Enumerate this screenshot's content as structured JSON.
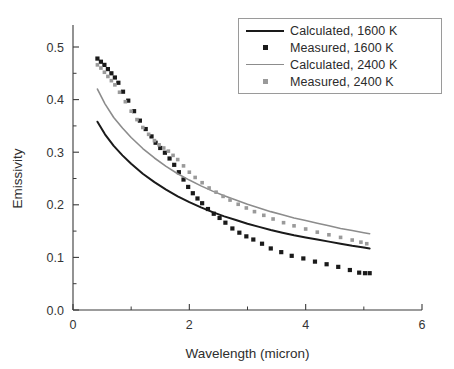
{
  "chart_data": {
    "type": "scatter",
    "title": "",
    "xlabel": "Wavelength (micron)",
    "ylabel": "Emissivity",
    "xlim": [
      0,
      6
    ],
    "ylim": [
      0.0,
      0.5
    ],
    "grid": false,
    "legend_position": "top-right",
    "x_ticks": [
      0,
      2,
      4,
      6
    ],
    "x_tick_labels": [
      "0",
      "2",
      "4",
      "6"
    ],
    "x_minor_ticks": [
      1,
      3,
      5
    ],
    "y_ticks": [
      0.0,
      0.1,
      0.2,
      0.3,
      0.4,
      0.5
    ],
    "y_tick_labels": [
      "0.0",
      "0.1",
      "0.2",
      "0.3",
      "0.4",
      "0.5"
    ],
    "y_minor_ticks": [
      0.05,
      0.15,
      0.25,
      0.35,
      0.45
    ],
    "series": [
      {
        "name": "Calculated, 1600 K",
        "style": "line",
        "color": "#1a1a1a",
        "width": 2.0,
        "x": [
          0.42,
          0.55,
          0.7,
          0.85,
          1.0,
          1.2,
          1.4,
          1.6,
          1.8,
          2.0,
          2.2,
          2.4,
          2.6,
          2.8,
          3.0,
          3.2,
          3.4,
          3.6,
          3.8,
          4.0,
          4.2,
          4.4,
          4.6,
          4.8,
          5.0,
          5.1
        ],
        "y": [
          0.358,
          0.334,
          0.312,
          0.294,
          0.278,
          0.259,
          0.243,
          0.229,
          0.216,
          0.205,
          0.195,
          0.186,
          0.178,
          0.171,
          0.164,
          0.158,
          0.152,
          0.147,
          0.142,
          0.138,
          0.134,
          0.13,
          0.126,
          0.122,
          0.119,
          0.117
        ]
      },
      {
        "name": "Measured, 1600 K",
        "style": "squares",
        "color": "#1a1a1a",
        "marker_size": 4.2,
        "x": [
          0.42,
          0.48,
          0.54,
          0.6,
          0.66,
          0.72,
          0.78,
          0.86,
          0.95,
          1.05,
          1.15,
          1.25,
          1.35,
          1.42,
          1.5,
          1.58,
          1.66,
          1.74,
          1.82,
          1.9,
          1.98,
          2.06,
          2.14,
          2.22,
          2.32,
          2.42,
          2.52,
          2.62,
          2.74,
          2.86,
          2.98,
          3.1,
          3.25,
          3.4,
          3.58,
          3.76,
          3.96,
          4.16,
          4.36,
          4.56,
          4.76,
          4.92,
          5.02,
          5.1
        ],
        "y": [
          0.478,
          0.472,
          0.466,
          0.458,
          0.45,
          0.442,
          0.432,
          0.415,
          0.398,
          0.378,
          0.36,
          0.344,
          0.33,
          0.318,
          0.308,
          0.299,
          0.288,
          0.276,
          0.262,
          0.248,
          0.234,
          0.222,
          0.212,
          0.203,
          0.192,
          0.183,
          0.175,
          0.166,
          0.155,
          0.147,
          0.14,
          0.134,
          0.126,
          0.117,
          0.11,
          0.103,
          0.098,
          0.092,
          0.087,
          0.082,
          0.076,
          0.071,
          0.07,
          0.07
        ]
      },
      {
        "name": "Calculated, 2400 K",
        "style": "line",
        "color": "#8c8c8c",
        "width": 1.6,
        "x": [
          0.42,
          0.55,
          0.7,
          0.85,
          1.0,
          1.2,
          1.4,
          1.6,
          1.8,
          2.0,
          2.2,
          2.4,
          2.6,
          2.8,
          3.0,
          3.2,
          3.4,
          3.6,
          3.8,
          4.0,
          4.2,
          4.4,
          4.6,
          4.8,
          5.0,
          5.1
        ],
        "y": [
          0.42,
          0.392,
          0.366,
          0.346,
          0.328,
          0.307,
          0.289,
          0.273,
          0.259,
          0.247,
          0.236,
          0.226,
          0.217,
          0.209,
          0.201,
          0.194,
          0.187,
          0.181,
          0.175,
          0.17,
          0.165,
          0.16,
          0.155,
          0.151,
          0.147,
          0.145
        ]
      },
      {
        "name": "Measured, 2400 K",
        "style": "squares",
        "color": "#9a9a9a",
        "marker_size": 3.6,
        "x": [
          0.42,
          0.48,
          0.54,
          0.6,
          0.66,
          0.72,
          0.8,
          0.9,
          1.0,
          1.1,
          1.2,
          1.3,
          1.4,
          1.48,
          1.56,
          1.64,
          1.72,
          1.8,
          1.9,
          2.0,
          2.1,
          2.22,
          2.34,
          2.46,
          2.58,
          2.7,
          2.84,
          2.98,
          3.12,
          3.28,
          3.44,
          3.62,
          3.8,
          4.0,
          4.2,
          4.4,
          4.6,
          4.8,
          4.95,
          5.05
        ],
        "y": [
          0.466,
          0.46,
          0.452,
          0.444,
          0.436,
          0.428,
          0.414,
          0.396,
          0.378,
          0.362,
          0.347,
          0.334,
          0.322,
          0.314,
          0.308,
          0.302,
          0.294,
          0.286,
          0.274,
          0.262,
          0.252,
          0.242,
          0.232,
          0.224,
          0.216,
          0.209,
          0.201,
          0.194,
          0.187,
          0.18,
          0.173,
          0.166,
          0.16,
          0.154,
          0.148,
          0.143,
          0.138,
          0.133,
          0.129,
          0.126
        ]
      }
    ]
  },
  "legend": {
    "items": [
      {
        "label": "Calculated, 1600 K",
        "marker": "line",
        "color": "#1a1a1a"
      },
      {
        "label": "Measured, 1600 K",
        "marker": "square",
        "color": "#1a1a1a"
      },
      {
        "label": "Calculated, 2400 K",
        "marker": "line",
        "color": "#8c8c8c"
      },
      {
        "label": "Measured, 2400 K",
        "marker": "square",
        "color": "#9a9a9a"
      }
    ]
  },
  "axes": {
    "x_title": "Wavelength (micron)",
    "y_title": "Emissivity"
  }
}
